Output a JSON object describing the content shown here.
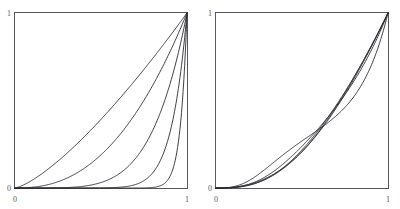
{
  "figure": {
    "title": "",
    "background_color": "#ffffff",
    "panel_count": 2
  },
  "axis": {
    "x_min_label": "0",
    "x_max_label": "1",
    "y_min_label": "0",
    "y_max_label": "1",
    "frame_color": "#58585c",
    "curve_color": "#2b2b30",
    "label_color": "#5a5a5a"
  },
  "chart_data": [
    {
      "type": "line",
      "title": "",
      "xlabel": "",
      "ylabel": "",
      "xlim": [
        0,
        1
      ],
      "ylim": [
        0,
        1
      ],
      "xticks": [
        0,
        1
      ],
      "xticklabels": [
        "0",
        "1"
      ],
      "yticks": [
        0,
        1
      ],
      "yticklabels": [
        "0",
        "1"
      ],
      "grid": false,
      "legend": "none",
      "description": "Five increasing convex curves on the unit square, each running from (0,0) to (1,1); curves are power-law shaped y = x^p with progressively larger exponents so later curves hug the bottom and right edges.",
      "x": [
        0,
        0.05,
        0.1,
        0.15,
        0.2,
        0.25,
        0.3,
        0.35,
        0.4,
        0.45,
        0.5,
        0.55,
        0.6,
        0.65,
        0.7,
        0.75,
        0.8,
        0.85,
        0.9,
        0.95,
        1
      ],
      "series": [
        {
          "name": "p = 1.35",
          "exponent": 1.35,
          "values": [
            0,
            0.0187,
            0.0477,
            0.0821,
            0.1205,
            0.1621,
            0.2065,
            0.2534,
            0.3027,
            0.3541,
            0.4076,
            0.4631,
            0.5205,
            0.5797,
            0.6407,
            0.7035,
            0.768,
            0.8341,
            0.902,
            0.9714,
            1
          ]
        },
        {
          "name": "p = 2.4",
          "exponent": 2.4,
          "values": [
            0,
            0.0006,
            0.0032,
            0.0086,
            0.0172,
            0.0293,
            0.0452,
            0.0652,
            0.0894,
            0.118,
            0.1512,
            0.1892,
            0.232,
            0.2799,
            0.333,
            0.3914,
            0.4552,
            0.5246,
            0.5996,
            0.6803,
            1
          ]
        },
        {
          "name": "p = 5",
          "exponent": 5,
          "values": [
            0,
            3e-07,
            1e-05,
            8e-05,
            0.00032,
            0.00098,
            0.00243,
            0.00525,
            0.01024,
            0.01845,
            0.03125,
            0.05033,
            0.07776,
            0.11603,
            0.16807,
            0.2373,
            0.32768,
            0.44371,
            0.59049,
            0.77378,
            1
          ]
        },
        {
          "name": "p = 11",
          "exponent": 11,
          "values": [
            0,
            0.0,
            0.0,
            0.0,
            2e-07,
            2e-07,
            1.8e-06,
            1.08e-05,
            4.19e-05,
            0.0001532,
            0.00049,
            0.00143,
            0.00363,
            0.00874,
            0.01977,
            0.04224,
            0.0859,
            0.16734,
            0.31381,
            0.5688,
            1
          ]
        },
        {
          "name": "p = 26",
          "exponent": 26,
          "values": [
            0,
            0.0,
            0.0,
            0.0,
            0.0,
            0.0,
            0.0,
            0.0,
            0.0,
            0.0,
            0.0,
            1e-07,
            2.8e-06,
            3.73e-05,
            0.0003937,
            0.0005559,
            0.00301,
            0.015,
            0.06636,
            0.26347,
            1
          ]
        }
      ]
    },
    {
      "type": "line",
      "title": "",
      "xlabel": "",
      "ylabel": "",
      "xlim": [
        0,
        1
      ],
      "ylim": [
        0,
        1
      ],
      "xticks": [
        0,
        1
      ],
      "xticklabels": [
        "0",
        "1"
      ],
      "yticks": [
        0,
        1
      ],
      "yticklabels": [
        "0",
        "1"
      ],
      "grid": false,
      "legend": "none",
      "description": "Five increasing convex curves on the unit square from (0,0) to (1,1); unlike the left panel these fan out from the origin with distinct finite initial slopes, the steepest nearly linear and the flattest bending sharply near x = 1.",
      "x": [
        0,
        0.05,
        0.1,
        0.15,
        0.2,
        0.25,
        0.3,
        0.35,
        0.4,
        0.45,
        0.5,
        0.55,
        0.6,
        0.65,
        0.7,
        0.75,
        0.8,
        0.85,
        0.9,
        0.95,
        1
      ],
      "series": [
        {
          "name": "k = 1.2",
          "shape": 1.2,
          "values": [
            0,
            0.0405,
            0.0829,
            0.1267,
            0.1719,
            0.2181,
            0.2654,
            0.3136,
            0.3627,
            0.4126,
            0.4633,
            0.5147,
            0.5668,
            0.6196,
            0.6731,
            0.7271,
            0.7818,
            0.837,
            0.8928,
            0.9491,
            1
          ]
        },
        {
          "name": "k = 2.0",
          "shape": 2.0,
          "values": [
            0,
            0.0215,
            0.0459,
            0.0729,
            0.1024,
            0.1342,
            0.1682,
            0.2042,
            0.2424,
            0.2824,
            0.3244,
            0.3681,
            0.4136,
            0.4608,
            0.5096,
            0.56,
            0.6119,
            0.6654,
            0.7203,
            0.7767,
            1
          ]
        },
        {
          "name": "k = 3.5",
          "shape": 3.5,
          "values": [
            0,
            0.008,
            0.0179,
            0.0297,
            0.0434,
            0.0591,
            0.0768,
            0.0966,
            0.1185,
            0.1426,
            0.169,
            0.1976,
            0.2286,
            0.262,
            0.2978,
            0.3362,
            0.3772,
            0.4208,
            0.4672,
            0.5163,
            1
          ]
        },
        {
          "name": "k = 6",
          "shape": 6,
          "values": [
            0,
            0.0028,
            0.0064,
            0.011,
            0.0165,
            0.0231,
            0.0308,
            0.0398,
            0.05,
            0.0617,
            0.0748,
            0.0895,
            0.1059,
            0.1241,
            0.1441,
            0.1662,
            0.1904,
            0.2169,
            0.2457,
            0.2771,
            1
          ]
        },
        {
          "name": "k = 14",
          "shape": 14,
          "values": [
            0,
            0.0009,
            0.0021,
            0.0036,
            0.0055,
            0.0079,
            0.0108,
            0.0142,
            0.0183,
            0.0231,
            0.0287,
            0.0353,
            0.0429,
            0.0517,
            0.0619,
            0.0737,
            0.0874,
            0.1033,
            0.1219,
            0.1438,
            1
          ]
        }
      ]
    }
  ]
}
